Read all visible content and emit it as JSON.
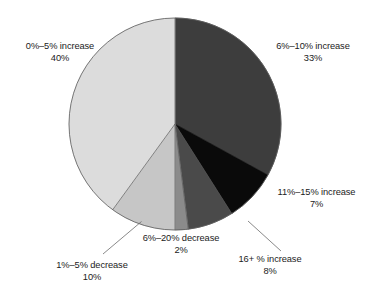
{
  "chart_data": {
    "type": "pie",
    "title": "",
    "subtitle": "",
    "xlabel": "",
    "ylabel": "",
    "legend_position": "none",
    "grid": false,
    "labels_inline": true,
    "start_angle_deg": 0,
    "direction": "clockwise",
    "categories": [
      "6%–10% increase",
      "16+ % increase",
      "11%–15% increase",
      "6%–20% decrease",
      "1%–5% decrease",
      "0%–5% increase"
    ],
    "values": [
      33,
      8,
      7,
      2,
      10,
      40
    ],
    "value_labels": [
      "33%",
      "8%",
      "7%",
      "2%",
      "10%",
      "40%"
    ],
    "colors": [
      "#3d3d3d",
      "#0a0a0a",
      "#4a4a4a",
      "#8b8b8b",
      "#c6c6c6",
      "#dcdcdc"
    ],
    "slices": [
      {
        "id": "6-10-increase",
        "name": "6%–10% increase",
        "value": 33,
        "value_label": "33%",
        "color": "#3d3d3d",
        "start_deg": 0,
        "end_deg": 118.8,
        "leader_line": false
      },
      {
        "id": "16plus-increase",
        "name": "16+ % increase",
        "value": 8,
        "value_label": "8%",
        "color": "#0a0a0a",
        "start_deg": 118.8,
        "end_deg": 147.6,
        "leader_line": true
      },
      {
        "id": "11-15-increase",
        "name": "11%–15% increase",
        "value": 7,
        "value_label": "7%",
        "color": "#4a4a4a",
        "start_deg": 147.6,
        "end_deg": 172.8,
        "leader_line": false
      },
      {
        "id": "6-20-decrease",
        "name": "6%–20% decrease",
        "value": 2,
        "value_label": "2%",
        "color": "#8b8b8b",
        "start_deg": 172.8,
        "end_deg": 180.0,
        "leader_line": false
      },
      {
        "id": "1-5-decrease",
        "name": "1%–5% decrease",
        "value": 10,
        "value_label": "10%",
        "color": "#c6c6c6",
        "start_deg": 180.0,
        "end_deg": 216.0,
        "leader_line": true
      },
      {
        "id": "0-5-increase",
        "name": "0%–5% increase",
        "value": 40,
        "value_label": "40%",
        "color": "#dcdcdc",
        "start_deg": 216.0,
        "end_deg": 360.0,
        "leader_line": false
      }
    ],
    "total": 100,
    "units": "percent"
  },
  "labels": {
    "top_left": {
      "name": "0%–5% increase",
      "value": "40%"
    },
    "top_right": {
      "name": "6%–10% increase",
      "value": "33%"
    },
    "right": {
      "name": "11%–15% increase",
      "value": "7%"
    },
    "bottom_right": {
      "name": "16+ % increase",
      "value": "8%"
    },
    "bottom_center": {
      "name": "6%–20% decrease",
      "value": "2%"
    },
    "bottom_left": {
      "name": "1%–5% decrease",
      "value": "10%"
    }
  },
  "style": {
    "background": "#ffffff",
    "text_color": "#1b1b1b",
    "outline_color": "#555555",
    "leader_line_color": "#6b6b6b"
  }
}
